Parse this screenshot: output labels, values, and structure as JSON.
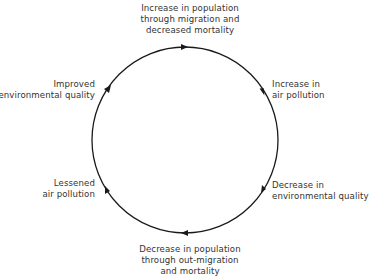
{
  "diagram": {
    "type": "cycle",
    "direction": "clockwise",
    "nodes": [
      {
        "id": "top",
        "lines": [
          "Increase in population",
          "through migration and",
          "decreased mortality"
        ]
      },
      {
        "id": "upper-right",
        "lines": [
          "Increase in",
          "air pollution"
        ]
      },
      {
        "id": "lower-right",
        "lines": [
          "Decrease in",
          "environmental quality"
        ]
      },
      {
        "id": "bottom",
        "lines": [
          "Decrease in population",
          "through out-migration",
          "and mortality"
        ]
      },
      {
        "id": "lower-left",
        "lines": [
          "Lessened",
          "air pollution"
        ]
      },
      {
        "id": "upper-left",
        "lines": [
          "Improved",
          "environmental quality"
        ]
      }
    ],
    "colors": {
      "line": "#1a1a1a",
      "text": "#333333",
      "background": "#ffffff"
    }
  }
}
